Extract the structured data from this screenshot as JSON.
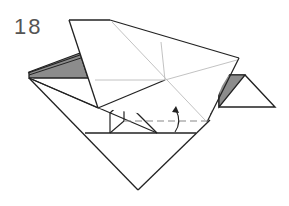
{
  "step": {
    "number": "18"
  },
  "diagram": {
    "type": "origami-instruction",
    "instruction_marks": [
      {
        "kind": "valley-fold-line",
        "style": "dashed"
      },
      {
        "kind": "fold-arrow",
        "direction": "up"
      }
    ],
    "colors": {
      "line": "#222222",
      "crease": "#bbbbbb",
      "shade": "#8c8c8c",
      "dash": "#888888",
      "paper": "#ffffff"
    }
  }
}
